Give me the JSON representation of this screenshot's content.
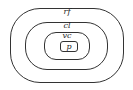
{
  "diagram": {
    "type": "nested-sets",
    "layers": [
      {
        "label": "rf"
      },
      {
        "label": "cl"
      },
      {
        "label": "vc"
      },
      {
        "label": "p"
      }
    ]
  }
}
